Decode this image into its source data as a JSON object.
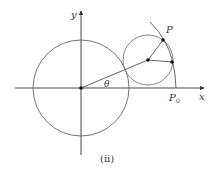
{
  "figure": {
    "caption": "(ii)",
    "labels": {
      "y_axis": "y",
      "x_axis": "x",
      "point_p": "P",
      "point_p0_main": "P",
      "point_p0_sub": "0",
      "angle": "θ"
    },
    "colors": {
      "stroke": "#555555",
      "axis": "#333333",
      "point": "#111111",
      "text": "#333333",
      "background": "#ffffff"
    }
  }
}
